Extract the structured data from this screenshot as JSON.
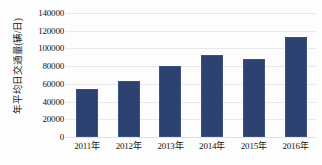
{
  "chart_data": {
    "type": "bar",
    "title": "",
    "xlabel": "",
    "ylabel": "年平均日交通量(辆/日)",
    "categories": [
      "2011年",
      "2012年",
      "2013年",
      "2014年",
      "2015年",
      "2016年"
    ],
    "values": [
      54000,
      63000,
      80000,
      93000,
      88000,
      113000
    ],
    "ylim": [
      0,
      140000
    ],
    "ytick_labels": [
      "0",
      "20000",
      "40000",
      "60000",
      "80000",
      "100000",
      "120000",
      "140000"
    ],
    "ytick_values": [
      0,
      20000,
      40000,
      60000,
      80000,
      100000,
      120000,
      140000
    ],
    "grid": true,
    "legend": false,
    "series": [
      {
        "name": "年平均日交通量",
        "values": [
          54000,
          63000,
          80000,
          93000,
          88000,
          113000
        ]
      }
    ],
    "colors": {
      "bar_fill": "#2d4271",
      "bar_border": "#3c5183",
      "gridline": "#e9e9ea",
      "background": "#fdfdfd",
      "text": "#151515"
    }
  }
}
